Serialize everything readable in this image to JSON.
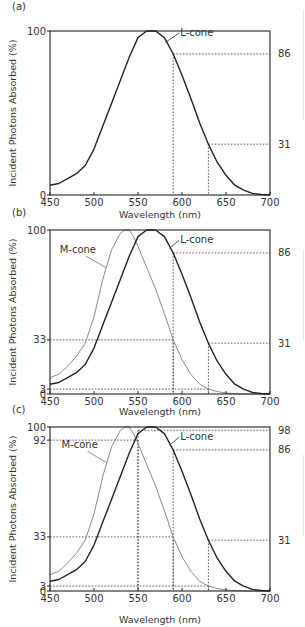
{
  "chart_data": [
    {
      "panel": "(a)",
      "type": "line",
      "title": "",
      "xlabel": "Wavelength (nm)",
      "ylabel": "Incident Photons Absorbed (%)",
      "xlim": [
        450,
        700
      ],
      "ylim": [
        0,
        100
      ],
      "x_ticks": [
        450,
        500,
        550,
        600,
        650,
        700
      ],
      "y_ticks_left": [
        0,
        100
      ],
      "y_ticks_right": [
        86,
        31
      ],
      "grid": false,
      "series": [
        {
          "name": "L-cone",
          "color": "#222222",
          "width": 1.4,
          "x": [
            450,
            460,
            470,
            480,
            490,
            500,
            510,
            520,
            530,
            540,
            550,
            555,
            560,
            565,
            570,
            580,
            590,
            600,
            610,
            620,
            630,
            640,
            650,
            660,
            670,
            680,
            690,
            700
          ],
          "y": [
            6,
            7,
            10,
            13,
            18,
            28,
            42,
            56,
            70,
            84,
            96,
            98,
            100,
            100,
            100,
            96,
            86,
            73,
            59,
            44,
            31,
            20,
            12,
            6,
            3,
            1,
            0.3,
            0
          ]
        }
      ],
      "guides": [
        {
          "x": 590,
          "y": 86
        },
        {
          "x": 630,
          "y": 31
        }
      ],
      "annotations": [
        {
          "text": "L-cone",
          "x": 598,
          "y": 97,
          "pointer_to": [
            581,
            93
          ]
        }
      ]
    },
    {
      "panel": "(b)",
      "type": "line",
      "title": "",
      "xlabel": "Wavelength (nm)",
      "ylabel": "Incident Photons Absorbed (%)",
      "xlim": [
        450,
        700
      ],
      "ylim": [
        0,
        100
      ],
      "x_ticks": [
        450,
        500,
        550,
        600,
        650,
        700
      ],
      "y_ticks_left": [
        0,
        3,
        33,
        100
      ],
      "y_ticks_right": [
        86,
        31
      ],
      "grid": false,
      "series": [
        {
          "name": "M-cone",
          "color": "#8a8a8a",
          "width": 1.0,
          "x": [
            450,
            460,
            470,
            480,
            490,
            500,
            510,
            520,
            530,
            535,
            540,
            545,
            550,
            560,
            570,
            580,
            590,
            600,
            610,
            620,
            630,
            640,
            650,
            660,
            670,
            680,
            690,
            700
          ],
          "y": [
            10,
            12,
            17,
            23,
            31,
            47,
            70,
            88,
            98,
            100,
            100,
            96,
            90,
            77,
            64,
            49,
            33,
            21,
            12,
            6,
            3,
            1.5,
            0.6,
            0.2,
            0,
            0,
            0,
            0
          ]
        },
        {
          "name": "L-cone",
          "color": "#222222",
          "width": 1.4,
          "x": [
            450,
            460,
            470,
            480,
            490,
            500,
            510,
            520,
            530,
            540,
            550,
            555,
            560,
            565,
            570,
            580,
            590,
            600,
            610,
            620,
            630,
            640,
            650,
            660,
            670,
            680,
            690,
            700
          ],
          "y": [
            6,
            7,
            10,
            13,
            18,
            28,
            42,
            56,
            70,
            84,
            96,
            98,
            100,
            100,
            100,
            96,
            86,
            73,
            59,
            44,
            31,
            20,
            12,
            6,
            3,
            1,
            0.3,
            0
          ]
        }
      ],
      "guides": [
        {
          "x": 590,
          "y": 86,
          "series": "L-cone"
        },
        {
          "x": 630,
          "y": 31,
          "series": "L-cone"
        },
        {
          "x": 590,
          "y": 33,
          "series": "M-cone"
        },
        {
          "x": 630,
          "y": 3,
          "series": "M-cone"
        }
      ],
      "annotations": [
        {
          "text": "M-cone",
          "x": 461,
          "y": 86,
          "pointer_to": [
            514,
            77
          ]
        },
        {
          "text": "L-cone",
          "x": 598,
          "y": 92,
          "pointer_to": [
            586,
            89
          ]
        }
      ]
    },
    {
      "panel": "(c)",
      "type": "line",
      "title": "",
      "xlabel": "Wavelength (nm)",
      "ylabel": "Incident Photons Absorbed (%)",
      "xlim": [
        450,
        700
      ],
      "ylim": [
        0,
        100
      ],
      "x_ticks": [
        450,
        500,
        550,
        600,
        650,
        700
      ],
      "y_ticks_left": [
        0,
        3,
        33,
        92,
        100
      ],
      "y_ticks_right": [
        98,
        86,
        31
      ],
      "grid": false,
      "series": [
        {
          "name": "M-cone",
          "color": "#8a8a8a",
          "width": 1.0,
          "x": [
            450,
            460,
            470,
            480,
            490,
            500,
            510,
            520,
            530,
            535,
            540,
            545,
            550,
            560,
            570,
            580,
            590,
            600,
            610,
            620,
            630,
            640,
            650,
            660,
            670,
            680,
            690,
            700
          ],
          "y": [
            10,
            12,
            17,
            23,
            31,
            47,
            70,
            88,
            98,
            100,
            100,
            96,
            90,
            77,
            64,
            49,
            33,
            21,
            12,
            6,
            3,
            1.5,
            0.6,
            0.2,
            0,
            0,
            0,
            0
          ]
        },
        {
          "name": "L-cone",
          "color": "#222222",
          "width": 1.4,
          "x": [
            450,
            460,
            470,
            480,
            490,
            500,
            510,
            520,
            530,
            540,
            550,
            555,
            560,
            565,
            570,
            580,
            590,
            600,
            610,
            620,
            630,
            640,
            650,
            660,
            670,
            680,
            690,
            700
          ],
          "y": [
            6,
            7,
            10,
            13,
            18,
            28,
            42,
            56,
            70,
            84,
            96,
            98,
            100,
            100,
            100,
            96,
            86,
            73,
            59,
            44,
            31,
            20,
            12,
            6,
            3,
            1,
            0.3,
            0
          ]
        }
      ],
      "guides": [
        {
          "x": 550,
          "y": 98,
          "series": "L-cone",
          "side": "right"
        },
        {
          "x": 550,
          "y": 92,
          "series": "M-cone",
          "side": "left"
        },
        {
          "x": 590,
          "y": 86,
          "series": "L-cone",
          "side": "right"
        },
        {
          "x": 630,
          "y": 31,
          "series": "L-cone",
          "side": "right"
        },
        {
          "x": 590,
          "y": 33,
          "series": "M-cone",
          "side": "left"
        },
        {
          "x": 630,
          "y": 3,
          "series": "M-cone",
          "side": "left"
        }
      ],
      "annotations": [
        {
          "text": "M-cone",
          "x": 463,
          "y": 87,
          "pointer_to": [
            515,
            78
          ]
        },
        {
          "text": "L-cone",
          "x": 598,
          "y": 92,
          "pointer_to": [
            586,
            89
          ]
        }
      ]
    }
  ],
  "labels": {
    "panel_a": "(a)",
    "panel_b": "(b)",
    "panel_c": "(c)",
    "xlabel": "Wavelength (nm)",
    "ylabel": "Incident Photons Absorbed (%)",
    "m_cone": "M-cone",
    "l_cone": "L-cone"
  }
}
